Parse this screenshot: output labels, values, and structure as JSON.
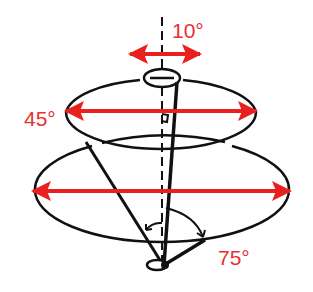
{
  "diagram": {
    "labels": {
      "top_angle": "10°",
      "middle_angle": "45°",
      "bottom_angle": "75°"
    },
    "colors": {
      "arrow": "#e8211f",
      "label": "#e8312f",
      "line": "#111111"
    }
  }
}
